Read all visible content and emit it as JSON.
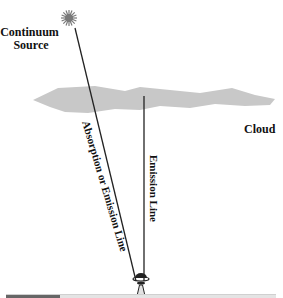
{
  "diagram": {
    "labels": {
      "source_line1": "Continuum",
      "source_line2": "Source",
      "cloud": "Cloud",
      "absorption_line": "Absorption or Emission Line",
      "emission_line": "Emission Line"
    },
    "colors": {
      "cloud": "#c8c8c8",
      "star": "#7a7a7a",
      "lines": "#222222",
      "text": "#111111"
    },
    "icons": {
      "source": "star-burst-icon",
      "observer": "telescope-icon"
    }
  },
  "progress": {
    "fraction": 0.2
  }
}
